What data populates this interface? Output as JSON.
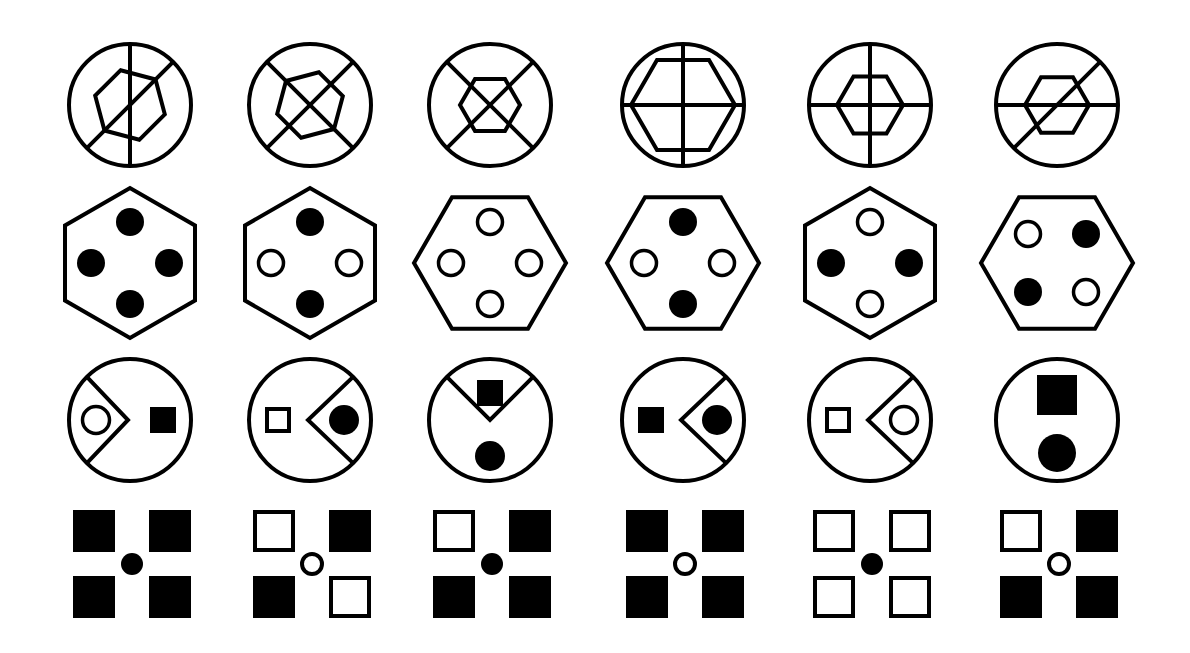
{
  "puzzle": {
    "rows": 4,
    "cols": 6,
    "colors": {
      "ink": "#000000",
      "background": "#ffffff"
    },
    "col_centers_x": [
      130,
      310,
      490,
      683,
      870,
      1057
    ]
  },
  "row1": {
    "description": "circle with lines and hexagon",
    "center_y": 105,
    "radius": 61,
    "items": [
      {
        "lines": [
          "vertical",
          "diag-up"
        ],
        "hexagon": {
          "rotation": 15,
          "r": 36,
          "dx": 0,
          "dy": 0
        }
      },
      {
        "lines": [
          "diag-up",
          "diag-down"
        ],
        "hexagon": {
          "rotation": -15,
          "r": 34,
          "dx": 0,
          "dy": 0
        }
      },
      {
        "lines": [
          "diag-up",
          "diag-down"
        ],
        "hexagon": {
          "rotation": 0,
          "r": 30,
          "dx": 0,
          "dy": 0
        }
      },
      {
        "lines": [
          "vertical",
          "horizontal"
        ],
        "hexagon": {
          "rotation": 0,
          "r": 52,
          "dx": 0,
          "dy": 0
        }
      },
      {
        "lines": [
          "vertical",
          "horizontal"
        ],
        "hexagon": {
          "rotation": 0,
          "r": 33,
          "dx": 0,
          "dy": 0
        }
      },
      {
        "lines": [
          "horizontal",
          "diag-up"
        ],
        "hexagon": {
          "rotation": 0,
          "r": 32,
          "dx": 0,
          "dy": 0
        }
      }
    ]
  },
  "row2": {
    "description": "hexagon with four dots",
    "center_y": 263,
    "items": [
      {
        "hex_orientation": "pointy",
        "dots": {
          "top": "filled",
          "left": "filled",
          "right": "filled",
          "bottom": "filled"
        }
      },
      {
        "hex_orientation": "pointy",
        "dots": {
          "top": "filled",
          "left": "hollow",
          "right": "hollow",
          "bottom": "filled"
        }
      },
      {
        "hex_orientation": "flat",
        "dots": {
          "top": "hollow",
          "left": "hollow",
          "right": "hollow",
          "bottom": "hollow"
        }
      },
      {
        "hex_orientation": "flat",
        "dots": {
          "top": "filled",
          "left": "hollow",
          "right": "hollow",
          "bottom": "filled"
        }
      },
      {
        "hex_orientation": "pointy",
        "dots": {
          "top": "hollow",
          "left": "filled",
          "right": "filled",
          "bottom": "hollow"
        }
      },
      {
        "hex_orientation": "flat",
        "dots": {
          "top-left": "hollow",
          "top-right": "filled",
          "bottom-left": "filled",
          "bottom-right": "hollow"
        }
      }
    ]
  },
  "row3": {
    "description": "circle with chevron partition, square and dot",
    "center_y": 420,
    "radius": 61,
    "items": [
      {
        "chevron": "left-opening-right",
        "square": {
          "style": "filled",
          "pos": "right"
        },
        "dot": {
          "style": "hollow",
          "pos": "left"
        }
      },
      {
        "chevron": "right-opening-left",
        "square": {
          "style": "hollow",
          "pos": "left"
        },
        "dot": {
          "style": "filled",
          "pos": "right"
        }
      },
      {
        "chevron": "top-opening-down",
        "square": {
          "style": "filled",
          "pos": "top"
        },
        "dot": {
          "style": "filled",
          "pos": "bottom"
        }
      },
      {
        "chevron": "right-opening-left",
        "square": {
          "style": "filled",
          "pos": "left"
        },
        "dot": {
          "style": "filled",
          "pos": "right"
        }
      },
      {
        "chevron": "right-opening-left",
        "square": {
          "style": "hollow",
          "pos": "left"
        },
        "dot": {
          "style": "hollow",
          "pos": "right"
        }
      },
      {
        "chevron": "none",
        "square": {
          "style": "filled",
          "pos": "top-large"
        },
        "dot": {
          "style": "filled",
          "pos": "bottom-large"
        }
      }
    ]
  },
  "row4": {
    "description": "four squares around center dot",
    "center_y": 564,
    "items": [
      {
        "squares": {
          "tl": "filled",
          "tr": "filled",
          "bl": "filled",
          "br": "filled"
        },
        "center": "filled"
      },
      {
        "squares": {
          "tl": "hollow",
          "tr": "filled",
          "bl": "filled",
          "br": "hollow"
        },
        "center": "hollow"
      },
      {
        "squares": {
          "tl": "hollow",
          "tr": "filled",
          "bl": "filled",
          "br": "filled"
        },
        "center": "filled"
      },
      {
        "squares": {
          "tl": "filled",
          "tr": "filled",
          "bl": "filled",
          "br": "filled"
        },
        "center": "hollow"
      },
      {
        "squares": {
          "tl": "hollow",
          "tr": "hollow",
          "bl": "hollow",
          "br": "hollow"
        },
        "center": "filled"
      },
      {
        "squares": {
          "tl": "hollow",
          "tr": "filled",
          "bl": "filled",
          "br": "filled"
        },
        "center": "hollow"
      }
    ]
  }
}
